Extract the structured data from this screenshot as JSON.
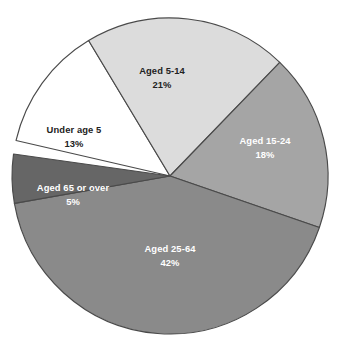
{
  "chart_data": {
    "type": "pie",
    "title": "",
    "xlabel": "",
    "ylabel": "",
    "legend": "none",
    "labels_position": "inside-slices",
    "start_angle_deg": -31,
    "direction": "clockwise",
    "categories": [
      "Under age 5",
      "Aged 5-14",
      "Aged 15-24",
      "Aged 25-64",
      "Aged 65 or over"
    ],
    "values": [
      13,
      21,
      18,
      42,
      5
    ],
    "value_suffix": "%",
    "total": 99,
    "slices": [
      {
        "label": "Under age 5",
        "value_text": "13%",
        "value": 13,
        "fill": "#ffffff",
        "text_color": "#222222",
        "start_deg": -77,
        "end_deg": -31,
        "label_x": 74,
        "label_y": 131,
        "value_x": 74,
        "value_y": 145
      },
      {
        "label": "Aged 5-14",
        "value_text": "21%",
        "value": 21,
        "fill": "#dcdcdc",
        "text_color": "#222222",
        "start_deg": -31,
        "end_deg": 44,
        "label_x": 162,
        "label_y": 72,
        "value_x": 162,
        "value_y": 86
      },
      {
        "label": "Aged 15-24",
        "value_text": "18%",
        "value": 18,
        "fill": "#a5a5a5",
        "text_color": "#ffffff",
        "start_deg": 44,
        "end_deg": 109,
        "label_x": 265,
        "label_y": 142,
        "value_x": 265,
        "value_y": 156
      },
      {
        "label": "Aged 25-64",
        "value_text": "42%",
        "value": 42,
        "fill": "#8a8a8a",
        "text_color": "#ffffff",
        "start_deg": 109,
        "end_deg": 260,
        "label_x": 170,
        "label_y": 250,
        "value_x": 170,
        "value_y": 264
      },
      {
        "label": "Aged 65 or over",
        "value_text": "5%",
        "value": 5,
        "fill": "#666666",
        "text_color": "#ffffff",
        "start_deg": 260,
        "end_deg": 278,
        "label_x": 73,
        "label_y": 189,
        "value_x": 73,
        "value_y": 203
      }
    ],
    "geometry": {
      "center_x": 170,
      "center_y": 176,
      "radius": 158
    },
    "colors": {
      "outline": "#4a4a4a",
      "background": "#ffffff",
      "under_5": "#ffffff",
      "aged_5_14": "#dcdcdc",
      "aged_15_24": "#a5a5a5",
      "aged_25_64": "#8a8a8a",
      "aged_65_over": "#666666"
    }
  }
}
